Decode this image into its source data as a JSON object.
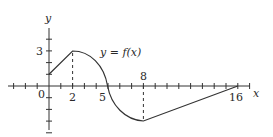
{
  "chart_data": {
    "type": "line",
    "title": "",
    "curve_label": "y = f(x)",
    "xlabel": "x",
    "ylabel": "y",
    "x_tick_labels": [
      "0",
      "2",
      "5",
      "8",
      "16"
    ],
    "y_tick_labels": [
      "3"
    ],
    "xlim": [
      -4,
      17
    ],
    "ylim": [
      -4,
      6
    ],
    "grid": false,
    "legend": "none",
    "dashed_guides": [
      {
        "x": 2,
        "from_y": 0,
        "to_y": 3
      },
      {
        "x": 8,
        "from_y": 0,
        "to_y": -3
      }
    ],
    "series": [
      {
        "name": "y = f(x)",
        "points": [
          {
            "x": 0,
            "y": 1
          },
          {
            "x": 2,
            "y": 3
          },
          {
            "x": 3,
            "y": 2.85
          },
          {
            "x": 4,
            "y": 2.2
          },
          {
            "x": 4.7,
            "y": 1.2
          },
          {
            "x": 5,
            "y": 0
          },
          {
            "x": 5.3,
            "y": -1.2
          },
          {
            "x": 6,
            "y": -2.2
          },
          {
            "x": 7,
            "y": -2.85
          },
          {
            "x": 8,
            "y": -3
          },
          {
            "x": 16,
            "y": 0
          }
        ]
      }
    ]
  },
  "labels": {
    "y_axis": "y",
    "x_axis": "x",
    "curve": "y = f(x)",
    "origin": "0",
    "x2": "2",
    "x5": "5",
    "x8": "8",
    "x16": "16",
    "y3": "3"
  }
}
